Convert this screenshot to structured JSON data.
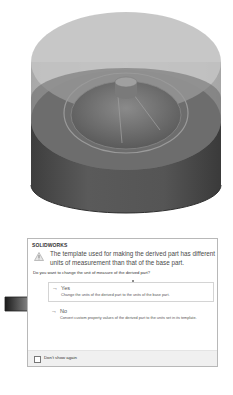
{
  "model_view": {
    "description": "3D cylindrical part with transparent upper body and conical cavity",
    "colors": {
      "upper_transparent": "#bdbdbd",
      "lower_solid": "#555555",
      "inner_cone": "#6e6e6e",
      "rim": "#8a8a8a"
    }
  },
  "dialog": {
    "title": "SOLIDWORKS",
    "icon": "warning-icon",
    "message": "The template used for making the derived part has different units of measurement than that of the base part.",
    "question": "Do you want to change the unit of measure of the derived part?",
    "options": [
      {
        "icon": "arrow-right-icon",
        "arrow_glyph": "→",
        "label": "Yes",
        "description": "Change the units of the derived part to the units of the base part.",
        "highlighted": true
      },
      {
        "icon": "arrow-right-icon",
        "arrow_glyph": "→",
        "label": "No",
        "description": "Convert custom property values of the derived part to the units set in its template.",
        "highlighted": false
      }
    ],
    "footer": {
      "checkbox_label": "Don't show again",
      "checked": false
    }
  },
  "annotation": {
    "type": "gradient-arrow",
    "points_to": "Yes"
  }
}
